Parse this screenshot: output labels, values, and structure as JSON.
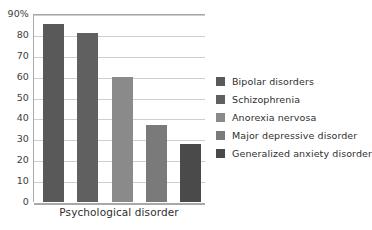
{
  "chart_data": {
    "type": "bar",
    "title": "",
    "xlabel": "Psychological disorder",
    "ylabel": "",
    "categories": [
      "Bipolar disorders",
      "Schizophrenia",
      "Anorexia nervosa",
      "Major depressive disorder",
      "Generalized anxiety disorder"
    ],
    "values": [
      85,
      81,
      60,
      37,
      28
    ],
    "ylim": [
      0,
      90
    ],
    "y_ticks": [
      0,
      10,
      20,
      30,
      40,
      50,
      60,
      70,
      80,
      90
    ],
    "y_tick_labels": [
      "0",
      "10",
      "20",
      "30",
      "40",
      "50",
      "60",
      "70",
      "80",
      "90%"
    ],
    "grid": true,
    "legend_position": "right",
    "colors": [
      "#595959",
      "#606060",
      "#8a8a8a",
      "#7a7a7a",
      "#4a4a4a"
    ],
    "series": [
      {
        "name": "Percentage",
        "values": [
          85,
          81,
          60,
          37,
          28
        ]
      }
    ]
  },
  "axes": {
    "x_title": "Psychological disorder"
  },
  "legend": {
    "items": [
      {
        "label": "Bipolar disorders",
        "color": "#595959"
      },
      {
        "label": "Schizophrenia",
        "color": "#606060"
      },
      {
        "label": "Anorexia nervosa",
        "color": "#8a8a8a"
      },
      {
        "label": "Major depressive disorder",
        "color": "#7a7a7a"
      },
      {
        "label": "Generalized anxiety disorder",
        "color": "#4a4a4a"
      }
    ]
  }
}
